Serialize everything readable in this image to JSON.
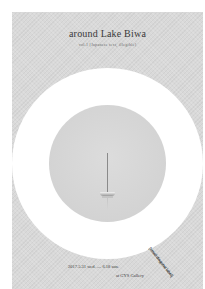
{
  "poster": {
    "title": "around Lake Biwa",
    "subtitle": "vol.1 [Japanese text, illegible]",
    "stamp": "[small diagonal label]",
    "date": "2017.5.31 wed. — 6.18 sun.",
    "venue": "at GYS Gallery"
  },
  "colors": {
    "page_background": "#ffffff",
    "poster_background": "#d9d9d9",
    "ring": "#ffffff",
    "inner_circle": "#d6d6d6",
    "text": "#3a3a3a"
  },
  "image": {
    "subject": "sailboat on calm lake",
    "icon": "sailboat-icon"
  }
}
